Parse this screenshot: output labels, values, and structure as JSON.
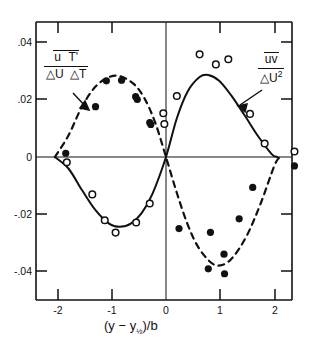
{
  "chart_data": {
    "type": "scatter",
    "title": "",
    "xlabel": "(y - y½)/b",
    "ylabel": "",
    "xlim": [
      -2.45,
      2.45
    ],
    "ylim": [
      -0.05,
      0.05
    ],
    "xticks": [
      -2,
      -1,
      0,
      1,
      2
    ],
    "xtick_labels": [
      "-2",
      "-1",
      "0",
      "1",
      "2"
    ],
    "yticks": [
      0.04,
      0.02,
      0,
      -0.02,
      -0.04
    ],
    "ytick_labels": [
      ".04",
      ".02",
      "0",
      "-.02",
      "-.04"
    ],
    "grid": false,
    "legend": "inline-annotations",
    "annotations": [
      {
        "name": "heat-flux-label",
        "numerator": "u T'",
        "denominator": "△U △T",
        "overbar": true,
        "points_to": "dashed-curve"
      },
      {
        "name": "reynolds-stress-label",
        "numerator": "uv",
        "denominator": "△U²",
        "overbar": true,
        "points_to": "solid-curve"
      }
    ],
    "series": [
      {
        "name": "u T' / △U △T",
        "marker": "filled-circle",
        "curve": "dashed",
        "points": [
          {
            "x": -1.85,
            "y": 0.0013
          },
          {
            "x": -1.3,
            "y": 0.0175
          },
          {
            "x": -1.1,
            "y": 0.0265
          },
          {
            "x": -0.82,
            "y": 0.0267
          },
          {
            "x": -0.56,
            "y": 0.021
          },
          {
            "x": -0.53,
            "y": 0.02
          },
          {
            "x": -0.3,
            "y": 0.012
          },
          {
            "x": -0.28,
            "y": 0.0113
          },
          {
            "x": 0.24,
            "y": -0.0249
          },
          {
            "x": 0.78,
            "y": -0.0389
          },
          {
            "x": 1.08,
            "y": -0.0406
          },
          {
            "x": 1.07,
            "y": -0.0338
          },
          {
            "x": 0.82,
            "y": -0.0262
          },
          {
            "x": 1.35,
            "y": -0.0215
          },
          {
            "x": 1.6,
            "y": -0.0106
          },
          {
            "x": 2.37,
            "y": -0.0031
          }
        ],
        "curve_points": [
          {
            "x": -2.05,
            "y": 0.0
          },
          {
            "x": -1.8,
            "y": 0.0075
          },
          {
            "x": -1.55,
            "y": 0.0175
          },
          {
            "x": -1.3,
            "y": 0.0245
          },
          {
            "x": -1.05,
            "y": 0.0278
          },
          {
            "x": -0.85,
            "y": 0.0281
          },
          {
            "x": -0.6,
            "y": 0.0255
          },
          {
            "x": -0.4,
            "y": 0.0205
          },
          {
            "x": -0.2,
            "y": 0.012
          },
          {
            "x": 0.0,
            "y": 0.0
          },
          {
            "x": 0.2,
            "y": -0.0125
          },
          {
            "x": 0.4,
            "y": -0.0235
          },
          {
            "x": 0.6,
            "y": -0.0315
          },
          {
            "x": 0.85,
            "y": -0.037
          },
          {
            "x": 1.05,
            "y": -0.0375
          },
          {
            "x": 1.25,
            "y": -0.0345
          },
          {
            "x": 1.5,
            "y": -0.027
          },
          {
            "x": 1.75,
            "y": -0.016
          },
          {
            "x": 2.0,
            "y": -0.003
          },
          {
            "x": 2.1,
            "y": 0.0
          }
        ]
      },
      {
        "name": "uv / △U²",
        "marker": "open-circle",
        "curve": "solid",
        "points": [
          {
            "x": -1.83,
            "y": -0.0018
          },
          {
            "x": -1.36,
            "y": -0.013
          },
          {
            "x": -1.13,
            "y": -0.022
          },
          {
            "x": -0.93,
            "y": -0.0263
          },
          {
            "x": -0.3,
            "y": -0.0162
          },
          {
            "x": -0.55,
            "y": -0.0228
          },
          {
            "x": -0.03,
            "y": 0.0115
          },
          {
            "x": -0.05,
            "y": 0.0152
          },
          {
            "x": 0.2,
            "y": 0.0212
          },
          {
            "x": 0.62,
            "y": 0.0357
          },
          {
            "x": 0.92,
            "y": 0.0322
          },
          {
            "x": 1.15,
            "y": 0.034
          },
          {
            "x": 1.55,
            "y": 0.015
          },
          {
            "x": 1.82,
            "y": 0.0047
          },
          {
            "x": 2.37,
            "y": 0.0019
          }
        ],
        "curve_points": [
          {
            "x": -2.05,
            "y": 0.0
          },
          {
            "x": -1.8,
            "y": -0.004
          },
          {
            "x": -1.55,
            "y": -0.0115
          },
          {
            "x": -1.3,
            "y": -0.0185
          },
          {
            "x": -1.05,
            "y": -0.0232
          },
          {
            "x": -0.85,
            "y": -0.0243
          },
          {
            "x": -0.65,
            "y": -0.0232
          },
          {
            "x": -0.45,
            "y": -0.0195
          },
          {
            "x": -0.25,
            "y": -0.0128
          },
          {
            "x": 0.0,
            "y": 0.0
          },
          {
            "x": 0.2,
            "y": 0.0135
          },
          {
            "x": 0.4,
            "y": 0.0228
          },
          {
            "x": 0.62,
            "y": 0.0278
          },
          {
            "x": 0.78,
            "y": 0.0285
          },
          {
            "x": 0.98,
            "y": 0.0265
          },
          {
            "x": 1.2,
            "y": 0.0215
          },
          {
            "x": 1.45,
            "y": 0.0145
          },
          {
            "x": 1.7,
            "y": 0.0072
          },
          {
            "x": 1.95,
            "y": 0.001
          },
          {
            "x": 2.05,
            "y": 0.0
          }
        ]
      }
    ]
  },
  "axes": {
    "ytick_labels": [
      ".04",
      ".02",
      "0",
      "-.02",
      "-.04"
    ],
    "xtick_labels": [
      "-2",
      "-1",
      "0",
      "1",
      "2"
    ]
  },
  "xaxis_title": {
    "open": "(y",
    "minus": "−",
    "y_sym": "y",
    "half": "½",
    "close": ")/b"
  },
  "left_label": {
    "num_u": "u",
    "num_t": "T'",
    "den_du": "△U",
    "den_dt": "△T"
  },
  "right_label": {
    "num": "uv",
    "den_du": "△U",
    "den_exp": "2"
  },
  "colors": {
    "ink": "#111111",
    "background": "#ffffff"
  }
}
